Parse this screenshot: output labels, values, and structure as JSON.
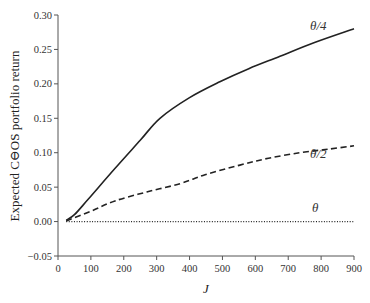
{
  "chart_data": {
    "type": "line",
    "title": "",
    "xlabel": "J",
    "ylabel": "Expected C⊖OS portfolio return",
    "xlim": [
      0,
      900
    ],
    "ylim": [
      -0.05,
      0.3
    ],
    "xticks": [
      0,
      100,
      200,
      300,
      400,
      500,
      600,
      700,
      800,
      900
    ],
    "yticks": [
      -0.05,
      0.0,
      0.05,
      0.1,
      0.15,
      0.2,
      0.25,
      0.3
    ],
    "xtick_labels": [
      "0",
      "100",
      "200",
      "300",
      "400",
      "500",
      "600",
      "700",
      "800",
      "900"
    ],
    "ytick_labels": [
      "−0.05",
      "0.00",
      "0.05",
      "0.10",
      "0.15",
      "0.20",
      "0.25",
      "0.30"
    ],
    "grid": false,
    "legend": "inline labels",
    "series": [
      {
        "name": "θ/4",
        "style": "solid",
        "x": [
          25,
          50,
          91,
          173,
          250,
          310,
          400,
          492,
          580,
          675,
          780,
          900
        ],
        "values": [
          0.002,
          0.01,
          0.032,
          0.077,
          0.118,
          0.15,
          0.18,
          0.203,
          0.222,
          0.24,
          0.26,
          0.28
        ]
      },
      {
        "name": "θ/2",
        "style": "dashed",
        "x": [
          25,
          100,
          173,
          270,
          371,
          447,
          553,
          640,
          736,
          820,
          900
        ],
        "values": [
          0.001,
          0.015,
          0.03,
          0.043,
          0.055,
          0.068,
          0.082,
          0.092,
          0.1,
          0.105,
          0.11
        ]
      },
      {
        "name": "θ",
        "style": "dotted",
        "x": [
          25,
          900
        ],
        "values": [
          0.0,
          0.0
        ]
      }
    ]
  }
}
